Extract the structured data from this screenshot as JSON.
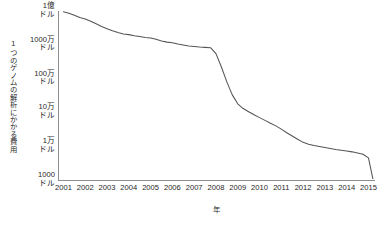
{
  "chart_data": {
    "type": "line",
    "title": "",
    "xlabel": "年",
    "ylabel": "1つのゲノムの解析にかかる費用",
    "x": [
      2001,
      2001.25,
      2001.5,
      2001.75,
      2002,
      2002.25,
      2002.5,
      2002.75,
      2003,
      2003.25,
      2003.5,
      2003.75,
      2004,
      2004.25,
      2004.5,
      2004.75,
      2005,
      2005.25,
      2005.5,
      2005.75,
      2006,
      2006.25,
      2006.5,
      2006.75,
      2007,
      2007.25,
      2007.5,
      2007.75,
      2008,
      2008.25,
      2008.5,
      2008.75,
      2009,
      2009.25,
      2009.5,
      2009.75,
      2010,
      2010.25,
      2010.5,
      2010.75,
      2011,
      2011.25,
      2011.5,
      2011.75,
      2012,
      2012.25,
      2012.5,
      2012.75,
      2013,
      2013.25,
      2013.5,
      2013.75,
      2014,
      2014.25,
      2014.5,
      2014.75,
      2015,
      2015.2
    ],
    "values": [
      95000000,
      86000000,
      75000000,
      64000000,
      58000000,
      50000000,
      42000000,
      35000000,
      30000000,
      26000000,
      23000000,
      21000000,
      20000000,
      18500000,
      17500000,
      16500000,
      16000000,
      14500000,
      13000000,
      12000000,
      11500000,
      10500000,
      9800000,
      9200000,
      8900000,
      8600000,
      8400000,
      8200000,
      5500000,
      2200000,
      800000,
      330000,
      180000,
      130000,
      105000,
      85000,
      70000,
      58000,
      48000,
      40000,
      32000,
      25000,
      20000,
      16000,
      13000,
      11500,
      10500,
      9800,
      9200,
      8600,
      8000,
      7600,
      7200,
      6800,
      6300,
      5800,
      4500,
      1100
    ],
    "ylim": [
      1000,
      100000000
    ],
    "xlim": [
      2000.75,
      2015.3
    ],
    "yscale": "log",
    "grid": false,
    "legend": false,
    "line_color": "#555555",
    "axis_color": "#8e8e8e",
    "background": "#ffffff",
    "yticks": [
      {
        "value": 100000000,
        "label_top": "1億",
        "label_bottom": "ドル"
      },
      {
        "value": 10000000,
        "label_top": "1000万",
        "label_bottom": "ドル"
      },
      {
        "value": 1000000,
        "label_top": "100万",
        "label_bottom": "ドル"
      },
      {
        "value": 100000,
        "label_top": "10万",
        "label_bottom": "ドル"
      },
      {
        "value": 10000,
        "label_top": "1万",
        "label_bottom": "ドル"
      },
      {
        "value": 1000,
        "label_top": "1000",
        "label_bottom": "ドル"
      }
    ],
    "xticks": [
      {
        "value": 2001,
        "label": "2001"
      },
      {
        "value": 2002,
        "label": "2002"
      },
      {
        "value": 2003,
        "label": "2003"
      },
      {
        "value": 2004,
        "label": "2004"
      },
      {
        "value": 2005,
        "label": "2005"
      },
      {
        "value": 2006,
        "label": "2006"
      },
      {
        "value": 2007,
        "label": "2007"
      },
      {
        "value": 2008,
        "label": "2008"
      },
      {
        "value": 2009,
        "label": "2009"
      },
      {
        "value": 2010,
        "label": "2010"
      },
      {
        "value": 2011,
        "label": "2011"
      },
      {
        "value": 2012,
        "label": "2012"
      },
      {
        "value": 2013,
        "label": "2013"
      },
      {
        "value": 2014,
        "label": "2014"
      },
      {
        "value": 2015,
        "label": "2015"
      }
    ]
  }
}
